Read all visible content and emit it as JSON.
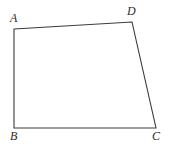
{
  "figure": {
    "type": "geometry-diagram",
    "canvas": {
      "width": 170,
      "height": 144,
      "background": "#ffffff"
    },
    "stroke": {
      "color": "#3a3a3a",
      "width": 1.1
    },
    "shape": {
      "name": "quadrilateral",
      "closed": true,
      "vertices": [
        {
          "id": "A",
          "label": "A",
          "x": 14,
          "y": 29
        },
        {
          "id": "D",
          "label": "D",
          "x": 132,
          "y": 22
        },
        {
          "id": "C",
          "label": "C",
          "x": 156,
          "y": 128
        },
        {
          "id": "B",
          "label": "B",
          "x": 14,
          "y": 128
        }
      ],
      "edges": [
        {
          "id": "AD",
          "from": "A",
          "to": "D"
        },
        {
          "id": "DC",
          "from": "D",
          "to": "C"
        },
        {
          "id": "CB",
          "from": "C",
          "to": "B"
        },
        {
          "id": "BA",
          "from": "B",
          "to": "A"
        }
      ],
      "path": "M 14 29 L 132 22 L 156 128 L 14 128 Z"
    },
    "labels": {
      "A": "A",
      "B": "B",
      "C": "C",
      "D": "D"
    }
  }
}
